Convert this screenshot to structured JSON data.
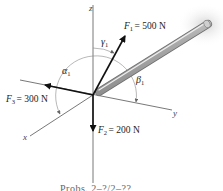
{
  "figure": {
    "axes": {
      "x": "x",
      "y": "y",
      "z": "z"
    },
    "forces": [
      {
        "id": "F1",
        "label": "F",
        "sub": "1",
        "value": "= 500 N"
      },
      {
        "id": "F2",
        "label": "F",
        "sub": "2",
        "value": "= 200 N"
      },
      {
        "id": "F3",
        "label": "F",
        "sub": "3",
        "value": "= 300 N"
      }
    ],
    "angles": {
      "alpha": "α",
      "alpha_sub": "1",
      "beta": "β",
      "beta_sub": "1",
      "gamma": "γ",
      "gamma_sub": "1"
    },
    "caption": "Probs. 2–?/2–??"
  },
  "colors": {
    "axis": "#555555",
    "arrow": "#111111",
    "rod": "#b0b0b0",
    "arc": "#777777"
  }
}
